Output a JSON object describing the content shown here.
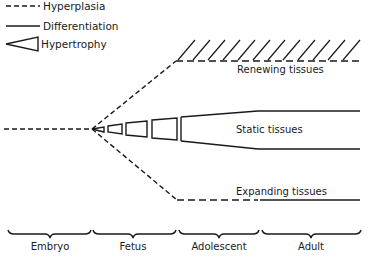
{
  "legend": {
    "items": [
      {
        "style": "dashed",
        "label": "Hyperplasia"
      },
      {
        "style": "solid",
        "label": "Differentiation"
      },
      {
        "style": "wedge",
        "label": "Hypertrophy"
      }
    ]
  },
  "regions": {
    "renewing": "Renewing tissues",
    "static": "Static tissues",
    "expanding": "Expanding tissues"
  },
  "stages": [
    {
      "label": "Embryo"
    },
    {
      "label": "Fetus"
    },
    {
      "label": "Adolescent"
    },
    {
      "label": "Adult"
    }
  ],
  "colors": {
    "ink": "#1a1a1a",
    "background": "#ffffff"
  }
}
